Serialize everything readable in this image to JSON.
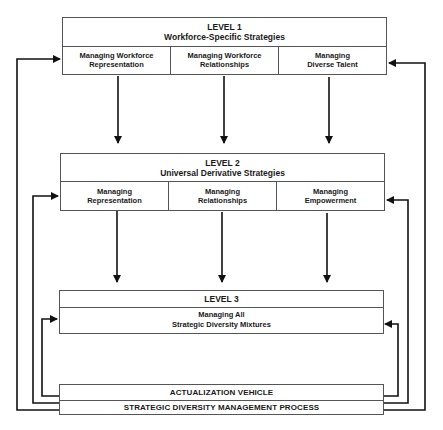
{
  "diagram": {
    "level1": {
      "title": "LEVEL 1",
      "subtitle": "Workforce-Specific Strategies",
      "cells": [
        "Managing Workforce\nRepresentation",
        "Managing Workforce\nRelationships",
        "Managing\nDiverse Talent"
      ]
    },
    "level2": {
      "title": "LEVEL 2",
      "subtitle": "Universal Derivative Strategies",
      "cells": [
        "Managing\nRepresentation",
        "Managing\nRelationships",
        "Managing\nEmpowerment"
      ]
    },
    "level3": {
      "title": "LEVEL 3",
      "content": "Managing All\nStrategic Diversity Mixtures"
    },
    "base": {
      "top_label": "ACTUALIZATION VEHICLE",
      "bottom_label": "STRATEGIC DIVERSITY MANAGEMENT PROCESS"
    },
    "line_color": "#111111",
    "border_color": "#555555"
  }
}
